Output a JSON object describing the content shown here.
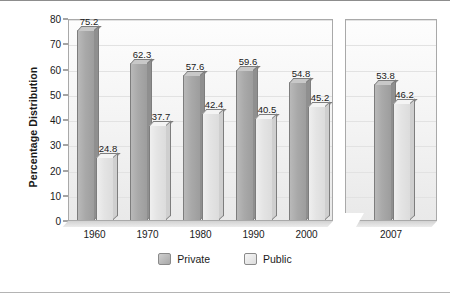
{
  "chart_data": {
    "type": "bar",
    "title": "",
    "xlabel": "",
    "ylabel": "Percentage Distribution",
    "categories": [
      "1960",
      "1970",
      "1980",
      "1990",
      "2000",
      "2007"
    ],
    "series": [
      {
        "name": "Private",
        "values": [
          75.2,
          62.3,
          57.6,
          59.6,
          54.8,
          53.8
        ]
      },
      {
        "name": "Public",
        "values": [
          24.8,
          37.7,
          42.4,
          40.5,
          45.2,
          46.2
        ]
      }
    ],
    "ylim": [
      0,
      80
    ],
    "yticks": [
      0,
      10,
      20,
      30,
      40,
      50,
      60,
      70,
      80
    ],
    "ytick_labels": [
      "0",
      "10",
      "20",
      "30",
      "40",
      "50",
      "60",
      "70",
      "80"
    ],
    "grid": true,
    "legend_position": "bottom",
    "axis_break_after_category": "2000",
    "data_labels": [
      "75.2",
      "24.8",
      "62.3",
      "37.7",
      "57.6",
      "42.4",
      "59.6",
      "40.5",
      "54.8",
      "45.2",
      "53.8",
      "46.2"
    ],
    "colors": {
      "private": "#a9a9a9",
      "public": "#e4e4e4",
      "bar_outline": "#7d7d7d",
      "panel_border": "#a9a9a9",
      "gridline": "#e2e2e2",
      "text": "#1a1a1a",
      "figure_border": "#8d8d8d",
      "panel_background": "#f3f3f3"
    }
  },
  "legend": {
    "items": [
      {
        "label": "Private",
        "key": "private"
      },
      {
        "label": "Public",
        "key": "public"
      }
    ]
  }
}
